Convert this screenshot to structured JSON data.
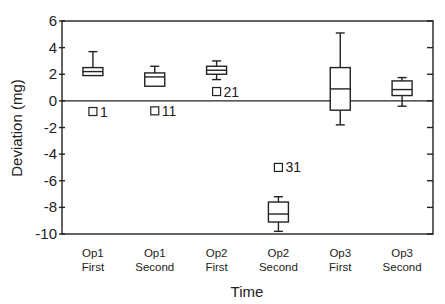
{
  "chart_data": {
    "type": "boxplot",
    "title": "",
    "xlabel": "Time",
    "ylabel": "Deviation (mg)",
    "ylim": [
      -10,
      6
    ],
    "yticks": [
      6,
      4,
      2,
      0,
      -2,
      -4,
      -6,
      -8,
      -10
    ],
    "reference_line": 0,
    "grid": false,
    "categories": [
      {
        "line1": "Op1",
        "line2": "First"
      },
      {
        "line1": "Op1",
        "line2": "Second"
      },
      {
        "line1": "Op2",
        "line2": "First"
      },
      {
        "line1": "Op2",
        "line2": "Second"
      },
      {
        "line1": "Op3",
        "line2": "First"
      },
      {
        "line1": "Op3",
        "line2": "Second"
      }
    ],
    "boxes": [
      {
        "whisker_low": 1.9,
        "q1": 1.9,
        "median": 2.2,
        "q3": 2.5,
        "whisker_high": 3.7,
        "outliers": [
          {
            "value": -0.8,
            "label": "1"
          }
        ]
      },
      {
        "whisker_low": 1.1,
        "q1": 1.1,
        "median": 1.8,
        "q3": 2.1,
        "whisker_high": 2.6,
        "outliers": [
          {
            "value": -0.75,
            "label": "11"
          }
        ]
      },
      {
        "whisker_low": 1.6,
        "q1": 2.0,
        "median": 2.3,
        "q3": 2.6,
        "whisker_high": 3.0,
        "outliers": [
          {
            "value": 0.7,
            "label": "21"
          }
        ]
      },
      {
        "whisker_low": -9.8,
        "q1": -9.1,
        "median": -8.5,
        "q3": -7.6,
        "whisker_high": -7.2,
        "outliers": [
          {
            "value": -5.0,
            "label": "31"
          }
        ]
      },
      {
        "whisker_low": -1.8,
        "q1": -0.7,
        "median": 0.9,
        "q3": 2.5,
        "whisker_high": 5.1,
        "outliers": []
      },
      {
        "whisker_low": -0.4,
        "q1": 0.4,
        "median": 0.85,
        "q3": 1.5,
        "whisker_high": 1.75,
        "outliers": []
      }
    ]
  }
}
